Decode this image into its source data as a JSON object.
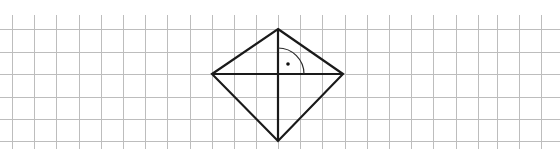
{
  "diagram": {
    "canvas": {
      "width": 560,
      "height": 149,
      "background": "#ffffff"
    },
    "grid": {
      "color": "#bdbdbd",
      "cell_size_px": 22.2,
      "vertical_x": [
        12,
        34,
        56,
        79,
        101,
        123,
        145,
        167,
        190,
        212,
        234,
        256,
        278,
        300,
        322,
        345,
        367,
        389,
        411,
        433,
        456,
        478,
        497,
        519,
        541
      ],
      "vertical_top": 15,
      "horizontal_y": [
        29,
        52,
        74,
        97,
        119,
        141
      ]
    },
    "shape": {
      "type": "rhombus",
      "stroke_color": "#1a1a1a",
      "vertices": {
        "top": [
          278,
          29
        ],
        "right": [
          343,
          74
        ],
        "bottom": [
          278,
          141
        ],
        "left": [
          212,
          74
        ]
      },
      "diagonals": [
        {
          "name": "horizontal-diagonal",
          "from": [
            212,
            74
          ],
          "to": [
            343,
            74
          ]
        },
        {
          "name": "vertical-diagonal",
          "from": [
            278,
            29
          ],
          "to": [
            278,
            141
          ]
        }
      ]
    },
    "right_angle_marker": {
      "center": [
        278,
        74
      ],
      "radius": 26,
      "dot": [
        288,
        64
      ]
    }
  }
}
